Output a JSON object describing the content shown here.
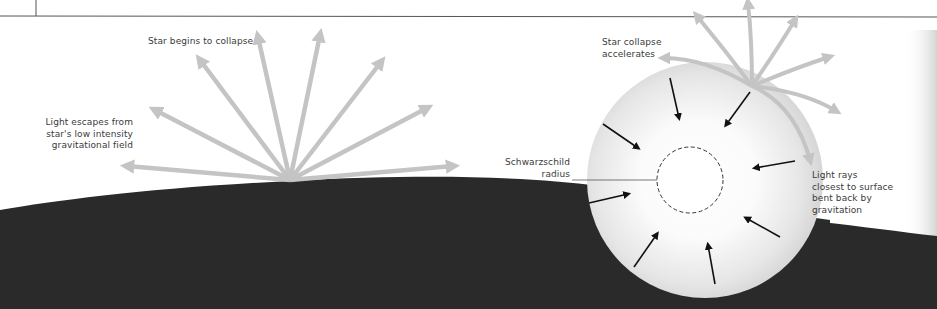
{
  "diagram": {
    "labels": {
      "star_begins": "Star begins to collapse",
      "light_escapes": [
        "Light escapes from",
        "star's low intensity",
        "gravitational field"
      ],
      "collapse_accelerates": [
        "Star collapse",
        "accelerates"
      ],
      "schwarzschild": [
        "Schwarzschild",
        "radius"
      ],
      "light_rays_bent": [
        "Light rays",
        "closest to surface",
        "bent back by",
        "gravitation"
      ]
    },
    "colors": {
      "background": "#ffffff",
      "ground": "#2a2a2a",
      "light_ray": "#c4c4c4",
      "collapse_arrow": "#111111",
      "star_fill_center": "#ffffff",
      "star_fill_edge": "#d6d6d6",
      "rule_line": "#555555",
      "text": "#3a3a3a"
    }
  }
}
